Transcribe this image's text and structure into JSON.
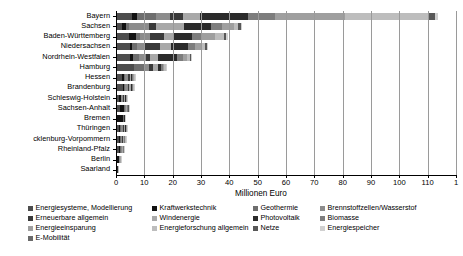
{
  "chart_data": {
    "type": "bar",
    "orientation": "horizontal",
    "stacked": true,
    "title": "",
    "xlabel": "Millionen Euro",
    "ylabel": "",
    "xlim": [
      0,
      120
    ],
    "xticks": [
      0,
      10,
      20,
      30,
      40,
      50,
      60,
      70,
      80,
      90,
      100,
      110,
      120
    ],
    "xticklabels": [
      "0",
      "10",
      "20",
      "30",
      "40",
      "50",
      "60",
      "70",
      "80",
      "90",
      "100",
      "110",
      "120"
    ],
    "xticklabel_last_clipped": "1",
    "grid": "vertical",
    "legend_position": "bottom",
    "categories": [
      "Bayern",
      "Sachsen",
      "Baden-Württemberg",
      "Niedersachsen",
      "Nordrhein-Westfalen",
      "Hamburg",
      "Hessen",
      "Brandenburg",
      "Schleswig-Holstein",
      "Sachsen-Anhalt",
      "Bremen",
      "Thüringen",
      "Mecklenburg-Vorpommern",
      "Rheinland-Pfalz",
      "Berlin",
      "Saarland"
    ],
    "categories_display": [
      "Bayern",
      "Sachsen",
      "Baden-Württemberg",
      "Niedersachsen",
      "Nordrhein-Westfalen",
      "Hamburg",
      "Hessen",
      "Brandenburg",
      "Schleswig-Holstein",
      "Sachsen-Anhalt",
      "Bremen",
      "Thüringen",
      "cklenburg-Vorpommern",
      "Rheinland-Pfalz",
      "Berlin",
      "Saarland"
    ],
    "series": [
      {
        "name": "Energiesysteme, Modellierung",
        "color": "#4d4d4d",
        "values": [
          5.5,
          2.0,
          4.5,
          5.0,
          5.0,
          6.5,
          2.0,
          2.5,
          1.0,
          1.5,
          0.4,
          1.0,
          1.0,
          1.2,
          0.5,
          0.2
        ]
      },
      {
        "name": "Kraftwerkstechnik",
        "color": "#121212",
        "values": [
          2.0,
          1.5,
          2.5,
          0.5,
          1.0,
          0.0,
          1.0,
          0.2,
          0.6,
          1.2,
          2.2,
          0.3,
          0.3,
          0.2,
          0.5,
          0.1
        ]
      },
      {
        "name": "Geothermie",
        "color": "#6e6e6e",
        "values": [
          6.5,
          1.0,
          1.5,
          2.0,
          2.0,
          3.5,
          0.3,
          0.4,
          0.3,
          0.4,
          0.1,
          0.5,
          0.5,
          0.3,
          0.2,
          0.05
        ]
      },
      {
        "name": "Brennstoffzellen/Wasserstof",
        "color": "#8c8c8c",
        "values": [
          5.0,
          7.0,
          3.5,
          2.5,
          2.5,
          1.5,
          1.0,
          1.0,
          0.5,
          0.3,
          0.1,
          0.6,
          0.4,
          0.3,
          0.2,
          0.05
        ]
      },
      {
        "name": "Erneuerbare allgemein",
        "color": "#3a3a3a",
        "values": [
          4.5,
          2.5,
          5.0,
          5.5,
          1.5,
          1.5,
          0.5,
          0.5,
          0.3,
          0.2,
          0.1,
          0.4,
          0.3,
          0.2,
          0.1,
          0.05
        ]
      },
      {
        "name": "Windenergie",
        "color": "#a8a8a8",
        "values": [
          6.0,
          10.0,
          3.0,
          4.0,
          3.0,
          2.0,
          0.5,
          0.6,
          0.4,
          0.2,
          0.1,
          0.3,
          0.3,
          0.2,
          0.1,
          0.05
        ]
      },
      {
        "name": "Photovoltaik",
        "color": "#2b2b2b",
        "values": [
          17.0,
          9.5,
          7.0,
          6.0,
          6.5,
          1.0,
          0.5,
          0.4,
          0.3,
          0.2,
          0.1,
          0.3,
          0.2,
          0.2,
          0.1,
          0.05
        ]
      },
      {
        "name": "Biomasse",
        "color": "#7d7d7d",
        "values": [
          9.5,
          4.0,
          3.0,
          2.5,
          2.0,
          0.5,
          0.3,
          0.3,
          0.2,
          0.2,
          0.1,
          0.2,
          0.2,
          0.1,
          0.1,
          0.05
        ]
      },
      {
        "name": "Energieeinsparung",
        "color": "#9f9f9f",
        "values": [
          25.0,
          4.0,
          5.0,
          2.0,
          1.5,
          0.5,
          0.3,
          0.2,
          0.2,
          0.1,
          0.05,
          0.2,
          0.1,
          0.1,
          0.05,
          0.05
        ]
      },
      {
        "name": "Energieforschung allgemein",
        "color": "#bdbdbd",
        "values": [
          29.0,
          1.5,
          3.0,
          1.5,
          1.0,
          0.5,
          0.2,
          0.2,
          0.1,
          0.1,
          0.05,
          0.1,
          0.1,
          0.1,
          0.05,
          0.05
        ]
      },
      {
        "name": "Netze",
        "color": "#585858",
        "values": [
          2.5,
          1.0,
          1.0,
          0.5,
          0.5,
          0.3,
          0.2,
          0.1,
          0.1,
          0.1,
          0.05,
          0.1,
          0.1,
          0.05,
          0.05,
          0.0
        ]
      },
      {
        "name": "Energiespeicher",
        "color": "#d0d0d0",
        "values": [
          1.0,
          0.5,
          0.5,
          0.3,
          0.3,
          0.2,
          0.1,
          0.1,
          0.1,
          0.05,
          0.05,
          0.05,
          0.05,
          0.05,
          0.05,
          0.0
        ]
      },
      {
        "name": "E-Mobilität",
        "color": "#6a6a6a",
        "values": [
          0.0,
          0.0,
          0.0,
          0.0,
          0.0,
          0.0,
          0.0,
          0.0,
          0.0,
          0.0,
          0.0,
          0.0,
          0.0,
          0.0,
          0.0,
          0.0
        ]
      }
    ],
    "totals": [
      113.5,
      44.5,
      39.5,
      32.3,
      26.8,
      18.0,
      6.9,
      6.5,
      4.1,
      4.55,
      3.4,
      4.05,
      3.55,
      3.0,
      2.05,
      0.72
    ]
  },
  "axis": {
    "x_title": "Millionen Euro",
    "ticks": [
      "0",
      "10",
      "20",
      "30",
      "40",
      "50",
      "60",
      "70",
      "80",
      "90",
      "100",
      "110",
      "1"
    ]
  },
  "y_labels": [
    "Bayern",
    "Sachsen",
    "Baden-Württemberg",
    "Niedersachsen",
    "Nordrhein-Westfalen",
    "Hamburg",
    "Hessen",
    "Brandenburg",
    "Schleswig-Holstein",
    "Sachsen-Anhalt",
    "Bremen",
    "Thüringen",
    "cklenburg-Vorpommern",
    "Rheinland-Pfalz",
    "Berlin",
    "Saarland"
  ],
  "legend": {
    "col1": [
      {
        "label": "Energiesysteme, Modellierung",
        "color": "#4d4d4d"
      },
      {
        "label": "Erneuerbare allgemein",
        "color": "#3a3a3a"
      },
      {
        "label": "Energieeinsparung",
        "color": "#9f9f9f"
      },
      {
        "label": "E-Mobilität",
        "color": "#6a6a6a"
      }
    ],
    "col2": [
      {
        "label": "Kraftwerkstechnik",
        "color": "#121212"
      },
      {
        "label": "Windenergie",
        "color": "#a8a8a8"
      },
      {
        "label": "Energieforschung allgemein",
        "color": "#bdbdbd"
      }
    ],
    "col3": [
      {
        "label": "Geothermie",
        "color": "#6e6e6e"
      },
      {
        "label": "Photovoltaik",
        "color": "#2b2b2b"
      },
      {
        "label": "Netze",
        "color": "#585858"
      }
    ],
    "col4": [
      {
        "label": "Brennstoffzellen/Wasserstof",
        "color": "#8c8c8c"
      },
      {
        "label": "Biomasse",
        "color": "#7d7d7d"
      },
      {
        "label": "Energiespeicher",
        "color": "#d0d0d0"
      }
    ]
  }
}
